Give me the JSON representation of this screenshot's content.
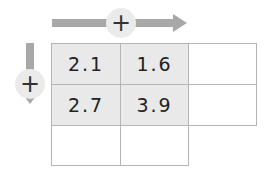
{
  "arrows": {
    "horizontal": {
      "label": "+",
      "direction": "right"
    },
    "vertical": {
      "label": "+",
      "direction": "down"
    }
  },
  "grid": {
    "rows": [
      [
        "2.1",
        "1.6",
        ""
      ],
      [
        "2.7",
        "3.9",
        ""
      ],
      [
        "",
        ""
      ]
    ]
  },
  "colors": {
    "arrow": "#a8a8a8",
    "filled_cell": "#e9e9e9",
    "border": "#b5b5b5"
  }
}
